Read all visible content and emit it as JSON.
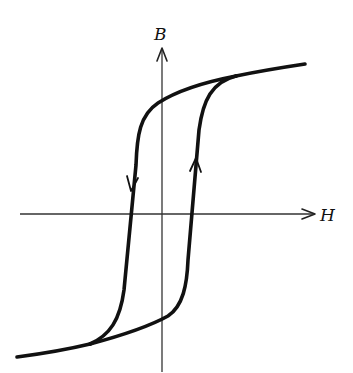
{
  "diagram": {
    "axes": {
      "x_label": "H",
      "y_label": "B"
    },
    "branches": [
      {
        "name": "descending",
        "direction": "down"
      },
      {
        "name": "ascending",
        "direction": "up"
      }
    ],
    "colors": {
      "curve": "#111111",
      "axis": "#333333",
      "background": "#ffffff"
    }
  }
}
